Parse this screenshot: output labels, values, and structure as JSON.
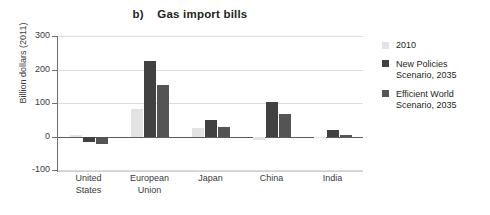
{
  "chart_data": {
    "type": "bar",
    "title": "b)    Gas import bills",
    "title_prefix": "b)",
    "title_text": "Gas import bills",
    "xlabel": "",
    "ylabel": "Billion dollars (2011)",
    "ylim": [
      -100,
      300
    ],
    "yticks": [
      300,
      200,
      100,
      0,
      -100
    ],
    "ytick_labels": [
      "300",
      "200",
      "100",
      "0",
      "-100"
    ],
    "grid": true,
    "grid_axis": "y",
    "legend_position": "right",
    "categories": [
      "United States",
      "European Union",
      "Japan",
      "China",
      "India"
    ],
    "category_lines": [
      [
        "United",
        "States"
      ],
      [
        "European",
        "Union"
      ],
      [
        "Japan"
      ],
      [
        "China"
      ],
      [
        "India"
      ]
    ],
    "series": [
      {
        "name": "2010",
        "color": "#e3e3e3",
        "values": [
          7,
          85,
          28,
          -8,
          -3
        ]
      },
      {
        "name": "New Policies Scenario, 2035",
        "name_lines": [
          "New Policies",
          "Scenario, 2035"
        ],
        "color": "#414141",
        "values": [
          -16,
          228,
          51,
          105,
          21
        ]
      },
      {
        "name": "Efficient World Scenario, 2035",
        "name_lines": [
          "Efficient World",
          "Scenario, 2035"
        ],
        "color": "#545454",
        "values": [
          -20,
          155,
          30,
          70,
          7
        ]
      }
    ]
  }
}
